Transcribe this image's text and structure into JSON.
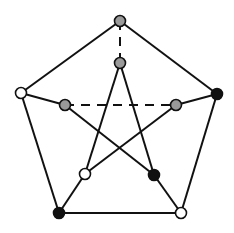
{
  "diagram": {
    "colors": {
      "background": "#ffffff",
      "edge": "#111111",
      "white": "#ffffff",
      "gray": "#9a9a9a",
      "black": "#111111",
      "stroke": "#111111"
    },
    "nodes": [
      {
        "id": "outer-top",
        "x": 120,
        "y": 21,
        "fill": "gray"
      },
      {
        "id": "outer-right",
        "x": 217,
        "y": 94,
        "fill": "black"
      },
      {
        "id": "outer-bottom-right",
        "x": 181,
        "y": 213,
        "fill": "white"
      },
      {
        "id": "outer-bottom-left",
        "x": 59,
        "y": 213,
        "fill": "black"
      },
      {
        "id": "outer-left",
        "x": 21,
        "y": 93,
        "fill": "white"
      },
      {
        "id": "inner-top",
        "x": 120,
        "y": 63,
        "fill": "gray"
      },
      {
        "id": "inner-right",
        "x": 176,
        "y": 105,
        "fill": "gray"
      },
      {
        "id": "inner-bottom-right",
        "x": 154,
        "y": 175,
        "fill": "black"
      },
      {
        "id": "inner-bottom-left",
        "x": 85,
        "y": 174,
        "fill": "white"
      },
      {
        "id": "inner-left",
        "x": 65,
        "y": 105,
        "fill": "gray"
      }
    ],
    "edges": [
      {
        "from": "outer-top",
        "to": "outer-right",
        "style": "solid"
      },
      {
        "from": "outer-right",
        "to": "outer-bottom-right",
        "style": "solid"
      },
      {
        "from": "outer-bottom-right",
        "to": "outer-bottom-left",
        "style": "solid"
      },
      {
        "from": "outer-bottom-left",
        "to": "outer-left",
        "style": "solid"
      },
      {
        "from": "outer-left",
        "to": "outer-top",
        "style": "solid"
      },
      {
        "from": "outer-top",
        "to": "inner-top",
        "style": "dashed"
      },
      {
        "from": "outer-right",
        "to": "inner-right",
        "style": "solid"
      },
      {
        "from": "outer-bottom-right",
        "to": "inner-bottom-right",
        "style": "solid"
      },
      {
        "from": "outer-bottom-left",
        "to": "inner-bottom-left",
        "style": "solid"
      },
      {
        "from": "outer-left",
        "to": "inner-left",
        "style": "solid"
      },
      {
        "from": "inner-top",
        "to": "inner-bottom-left",
        "style": "solid"
      },
      {
        "from": "inner-top",
        "to": "inner-bottom-right",
        "style": "solid"
      },
      {
        "from": "inner-left",
        "to": "inner-right",
        "style": "dashed"
      },
      {
        "from": "inner-left",
        "to": "inner-bottom-right",
        "style": "solid"
      },
      {
        "from": "inner-right",
        "to": "inner-bottom-left",
        "style": "solid"
      }
    ],
    "node_radius": 5.5,
    "edge_width": 2
  }
}
